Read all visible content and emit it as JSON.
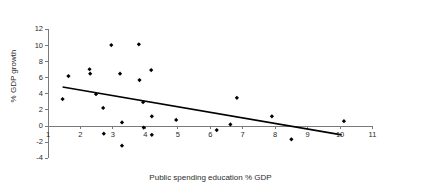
{
  "chart_data": {
    "type": "scatter",
    "title": "",
    "xlabel": "Public spending education % GDP",
    "ylabel": "% GDP growth",
    "xlim": [
      1,
      11
    ],
    "ylim": [
      -4,
      12
    ],
    "xticks": [
      1,
      2,
      3,
      4,
      5,
      6,
      7,
      8,
      9,
      10,
      11
    ],
    "xtick_labels": [
      "1",
      "2",
      "3",
      "4",
      "5",
      "6",
      "7",
      "8",
      "9",
      "10",
      "11"
    ],
    "yticks": [
      -4,
      -2,
      0,
      2,
      4,
      6,
      8,
      10,
      12
    ],
    "ytick_labels": [
      "-4",
      "-2",
      "0",
      "2",
      "4",
      "6",
      "8",
      "10",
      "12"
    ],
    "grid": false,
    "legend": null,
    "marker": "diamond",
    "marker_color": "#000000",
    "points": [
      {
        "x": 1.45,
        "y": 3.35
      },
      {
        "x": 1.63,
        "y": 6.2
      },
      {
        "x": 2.28,
        "y": 7.05
      },
      {
        "x": 2.3,
        "y": 6.5
      },
      {
        "x": 2.48,
        "y": 3.95
      },
      {
        "x": 2.7,
        "y": 2.25
      },
      {
        "x": 2.72,
        "y": -0.95
      },
      {
        "x": 2.95,
        "y": 10.05
      },
      {
        "x": 3.22,
        "y": 6.5
      },
      {
        "x": 3.28,
        "y": 0.45
      },
      {
        "x": 3.28,
        "y": -2.45
      },
      {
        "x": 3.8,
        "y": 10.15
      },
      {
        "x": 3.82,
        "y": 5.7
      },
      {
        "x": 3.93,
        "y": 2.95
      },
      {
        "x": 3.95,
        "y": -0.2
      },
      {
        "x": 4.18,
        "y": 6.95
      },
      {
        "x": 4.2,
        "y": 1.2
      },
      {
        "x": 4.2,
        "y": -1.1
      },
      {
        "x": 4.95,
        "y": 0.75
      },
      {
        "x": 6.2,
        "y": -0.5
      },
      {
        "x": 6.62,
        "y": 0.2
      },
      {
        "x": 6.82,
        "y": 3.5
      },
      {
        "x": 7.9,
        "y": 1.2
      },
      {
        "x": 8.5,
        "y": -1.65
      },
      {
        "x": 10.12,
        "y": 0.6
      }
    ],
    "trendline": {
      "type": "linear",
      "x_start": 1.45,
      "y_start": 4.85,
      "x_end": 10.05,
      "y_end": -1.1
    },
    "axis_color": "#7a7a7a",
    "text_color": "#2b2b2b"
  }
}
